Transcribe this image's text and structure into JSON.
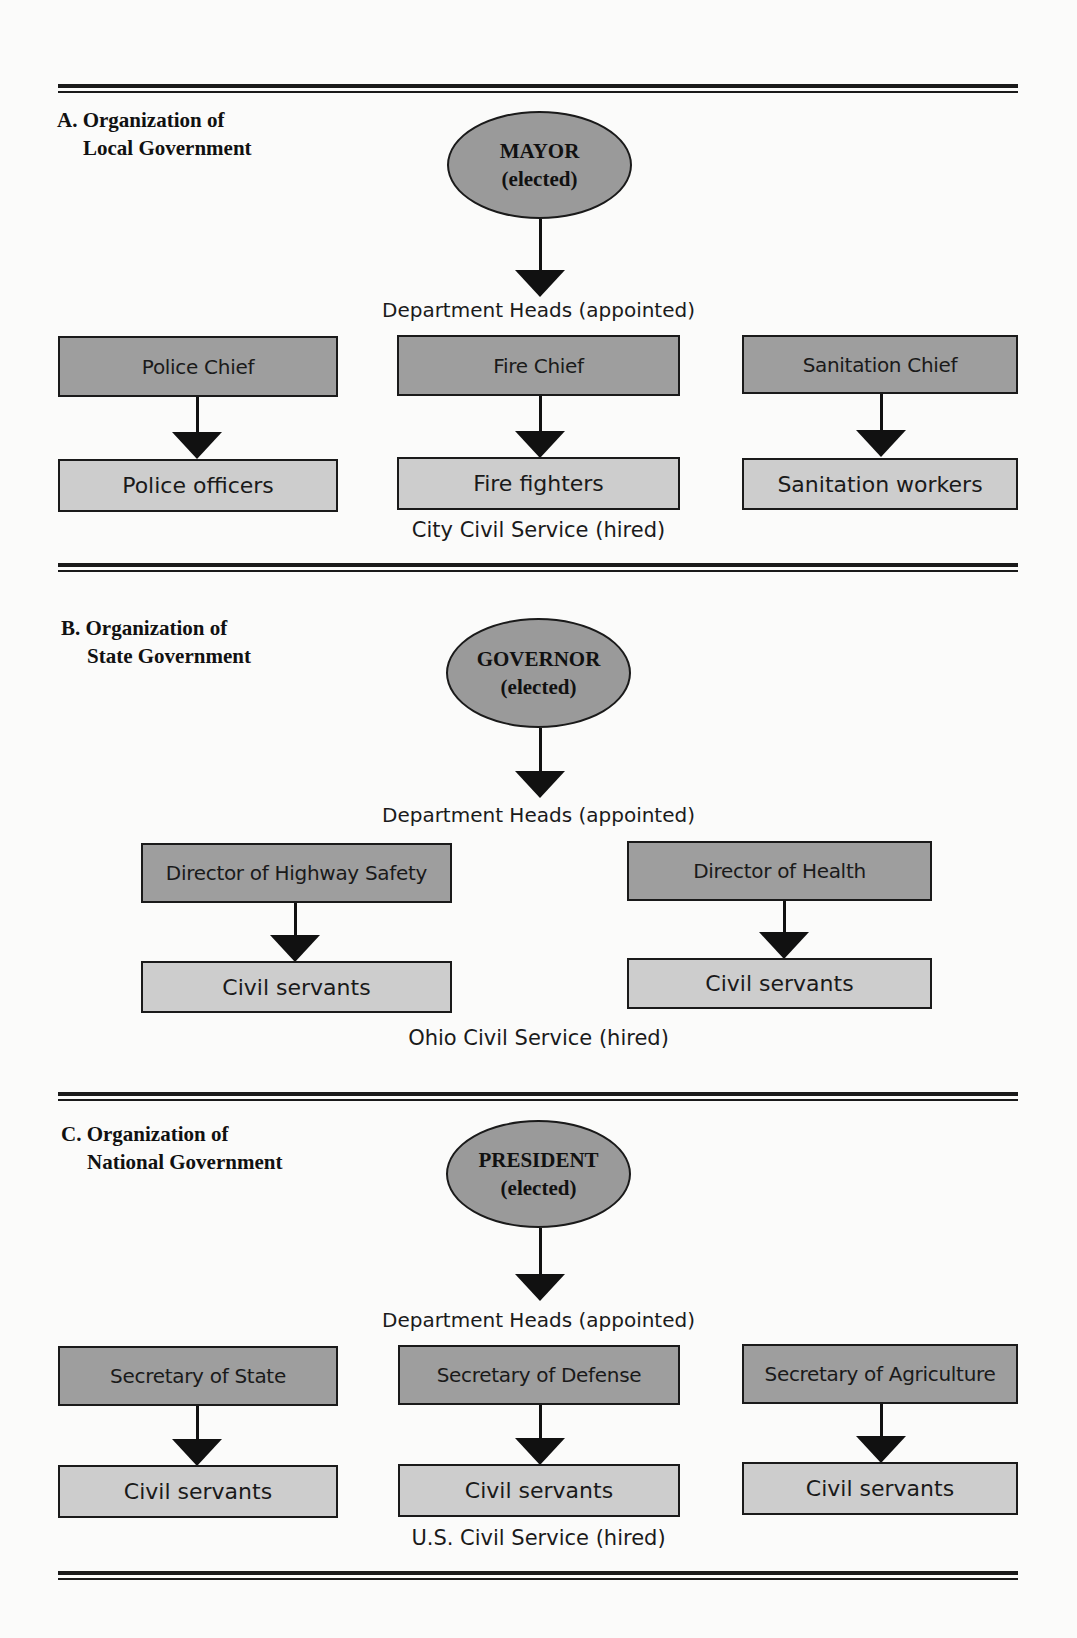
{
  "sections": [
    {
      "title_line1": "A. Organization of",
      "title_line2": "Local Government",
      "leader": {
        "name": "MAYOR",
        "status": "(elected)"
      },
      "heads_caption": "Department Heads (appointed)",
      "departments": [
        {
          "head": "Police Chief",
          "staff": "Police officers"
        },
        {
          "head": "Fire Chief",
          "staff": "Fire fighters"
        },
        {
          "head": "Sanitation Chief",
          "staff": "Sanitation workers"
        }
      ],
      "service_caption": "City Civil Service (hired)"
    },
    {
      "title_line1": "B. Organization of",
      "title_line2": "State Government",
      "leader": {
        "name": "GOVERNOR",
        "status": "(elected)"
      },
      "heads_caption": "Department Heads (appointed)",
      "departments": [
        {
          "head": "Director of Highway Safety",
          "staff": "Civil servants"
        },
        {
          "head": "Director of Health",
          "staff": "Civil servants"
        }
      ],
      "service_caption": "Ohio Civil Service (hired)"
    },
    {
      "title_line1": "C. Organization of",
      "title_line2": "National Government",
      "leader": {
        "name": "PRESIDENT",
        "status": "(elected)"
      },
      "heads_caption": "Department Heads (appointed)",
      "departments": [
        {
          "head": "Secretary of State",
          "staff": "Civil servants"
        },
        {
          "head": "Secretary of Defense",
          "staff": "Civil servants"
        },
        {
          "head": "Secretary of Agriculture",
          "staff": "Civil servants"
        }
      ],
      "service_caption": "U.S. Civil Service (hired)"
    }
  ],
  "colors": {
    "leader_fill": "#9a9a9a",
    "head_fill": "#9e9e9e",
    "staff_fill": "#cdcdcd",
    "line": "#1a1a1a"
  }
}
